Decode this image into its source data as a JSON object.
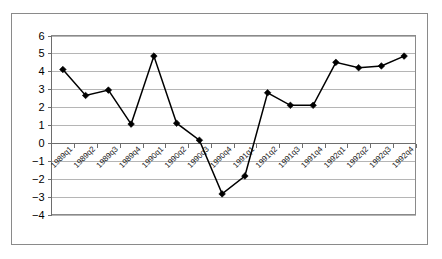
{
  "chart_data": {
    "type": "line",
    "title": "",
    "subtitle": "",
    "xlabel": "",
    "ylabel": "",
    "categories": [
      "1989q1",
      "1989q2",
      "1989q3",
      "1989q4",
      "1990q1",
      "1990q2",
      "1990q3",
      "1990q4",
      "1991q1",
      "1991q2",
      "1991q3",
      "1991q4",
      "1992q1",
      "1992q2",
      "1992q3",
      "1992q4"
    ],
    "values": [
      4.1,
      2.65,
      2.95,
      1.05,
      4.85,
      1.1,
      0.15,
      -2.85,
      -1.85,
      2.8,
      2.1,
      2.1,
      4.5,
      4.2,
      4.3,
      4.85
    ],
    "series": [
      {
        "name": "",
        "values": [
          4.1,
          2.65,
          2.95,
          1.05,
          4.85,
          1.1,
          0.15,
          -2.85,
          -1.85,
          2.8,
          2.1,
          2.1,
          4.5,
          4.2,
          4.3,
          4.85
        ]
      }
    ],
    "ylim": [
      -4,
      6
    ],
    "yticks": [
      6,
      5,
      4,
      3,
      2,
      1,
      0,
      -1,
      -2,
      -3,
      -4
    ],
    "ytick_labels": [
      "6",
      "5",
      "4",
      "3",
      "2",
      "1",
      "0",
      "−1",
      "−2",
      "−3",
      "−4"
    ],
    "xtick_labels": [
      "1989q1",
      "1989q2",
      "1989q3",
      "1989q4",
      "1990q1",
      "1990q2",
      "1990q3",
      "1990q4",
      "1991q1",
      "1991q2",
      "1991q3",
      "1991q4",
      "1992q1",
      "1992q2",
      "1992q3",
      "1992q4"
    ],
    "xtick_label_rotation": -45,
    "grid": true,
    "grid_axis": "y",
    "legend": false,
    "legend_position": "none",
    "marker": "diamond",
    "marker_color": "#000000",
    "line_color": "#000000",
    "gridline_color": "#b5b5b5",
    "axis_color": "#6d6d6d",
    "plot_background": "#ffffff",
    "frame_border_color": "#8a8a8a",
    "annotations": []
  }
}
